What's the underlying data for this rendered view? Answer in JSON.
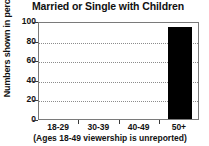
{
  "chart_data": {
    "type": "bar",
    "title": "Married or Single with Children",
    "xlabel": "(Ages 18-49 viewership is unreported)",
    "ylabel": "Numbers shown in percentages",
    "categories": [
      "18-29",
      "30-39",
      "40-49",
      "50+"
    ],
    "values": [
      0,
      0,
      0,
      94
    ],
    "ylim": [
      0,
      100
    ],
    "yticks": [
      0,
      20,
      40,
      60,
      80,
      100
    ],
    "ytick_labels": [
      "0",
      "20",
      "40",
      "60",
      "80",
      "100"
    ],
    "grid": true,
    "legend": false,
    "bar_color": "#000000",
    "axis_color": "#7a7a7a",
    "grid_color": "#8c8c8c",
    "background": "#ffffff"
  },
  "caption": "(Ages 18-49 viewership is unreported)"
}
